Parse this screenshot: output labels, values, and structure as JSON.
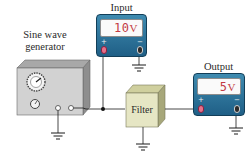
{
  "diagram": {
    "generator": {
      "label_line1": "Sine wave",
      "label_line2": "generator"
    },
    "filter": {
      "label": "Filter"
    },
    "input_meter": {
      "title": "Input",
      "reading": "10",
      "unit": "V",
      "plus": "+",
      "minus": "−"
    },
    "output_meter": {
      "title": "Output",
      "reading": "5",
      "unit": "V",
      "plus": "+",
      "minus": "−"
    },
    "colors": {
      "meter_body": "#2a6f96",
      "reading": "#c33a44",
      "filter_face": "#e6e6c4",
      "generator_face": "#d2d2d2",
      "wire": "#1a1a1a"
    }
  }
}
